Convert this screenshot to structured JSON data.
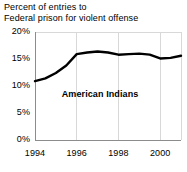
{
  "chart_data": {
    "type": "line",
    "title": "Percent of entries to\nFederal prison for violent offense",
    "xlabel": "",
    "ylabel": "",
    "xlim": [
      1994,
      2001
    ],
    "ylim": [
      0,
      20
    ],
    "grid": true,
    "legend_position": "inline-label",
    "series": [
      {
        "name": "American Indians",
        "x": [
          1994,
          1994.5,
          1995,
          1995.5,
          1996,
          1996.5,
          1997,
          1997.5,
          1998,
          1998.5,
          1999,
          1999.5,
          2000,
          2000.5,
          2001
        ],
        "values": [
          10.9,
          11.4,
          12.4,
          13.8,
          15.9,
          16.2,
          16.4,
          16.2,
          15.8,
          15.9,
          16.0,
          15.8,
          15.1,
          15.2,
          15.6
        ]
      }
    ],
    "annotations": [
      {
        "text": "American Indians",
        "x": 1997.2,
        "y": 8.4
      }
    ],
    "yticks": [
      {
        "value": 20,
        "label": "20%"
      },
      {
        "value": 15,
        "label": "15%"
      },
      {
        "value": 10,
        "label": "10%"
      },
      {
        "value": 5,
        "label": "5%"
      },
      {
        "value": 0,
        "label": "0%"
      }
    ],
    "xticks": [
      {
        "value": 1994,
        "label": "1994"
      },
      {
        "value": 1996,
        "label": "1996"
      },
      {
        "value": 1998,
        "label": "1998"
      },
      {
        "value": 2000,
        "label": "2000"
      }
    ],
    "colors": {
      "line": "#000000",
      "grid": "#d8d8d8",
      "axis": "#8c8c8c",
      "background": "#ffffff",
      "text": "#000000"
    }
  }
}
